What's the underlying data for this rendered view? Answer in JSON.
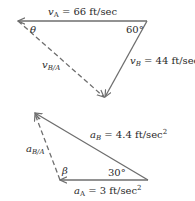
{
  "velocity_diagram": {
    "vA": {
      "symbol": "v",
      "sub": "A",
      "value": " = 66 ft/sec"
    },
    "vB": {
      "symbol": "v",
      "sub": "B",
      "value": " = 44 ft/sec"
    },
    "vBA": {
      "symbol": "v",
      "sub": "B/A"
    },
    "angle_theta": "θ",
    "angle_60": "60°"
  },
  "acceleration_diagram": {
    "aA": {
      "symbol": "a",
      "sub": "A",
      "value": " = 3 ft/sec",
      "sup": "2"
    },
    "aB": {
      "symbol": "a",
      "sub": "B",
      "value": " = 4.4 ft/sec",
      "sup": "2"
    },
    "aBA": {
      "symbol": "a",
      "sub": "B/A"
    },
    "angle_beta": "β",
    "angle_30": "30°"
  }
}
